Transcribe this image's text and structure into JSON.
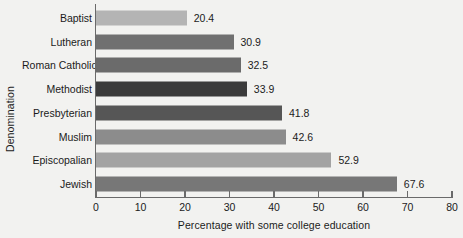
{
  "chart_data": {
    "type": "bar",
    "orientation": "horizontal",
    "title": "",
    "xlabel": "Percentage with some college education",
    "ylabel": "Denomination",
    "xlim": [
      0,
      80
    ],
    "xticks": [
      0,
      10,
      20,
      30,
      40,
      50,
      60,
      70,
      80
    ],
    "grid": false,
    "legend": false,
    "categories": [
      "Baptist",
      "Lutheran",
      "Roman Catholic",
      "Methodist",
      "Presbyterian",
      "Muslim",
      "Episcopalian",
      "Jewish"
    ],
    "values": [
      20.4,
      30.9,
      32.5,
      33.9,
      41.8,
      42.6,
      52.9,
      67.6
    ],
    "value_labels": [
      "20.4",
      "30.9",
      "32.5",
      "33.9",
      "41.8",
      "42.6",
      "52.9",
      "67.6"
    ],
    "bar_colors": [
      "#b4b4b4",
      "#707070",
      "#6b6b6b",
      "#3b3b3b",
      "#565656",
      "#8c8c8c",
      "#a3a3a3",
      "#777777"
    ],
    "axis_color": "#6a6a6a",
    "text_color": "#1b1b1b",
    "background_color": "#f2f2f0"
  }
}
